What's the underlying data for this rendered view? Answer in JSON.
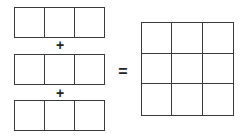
{
  "diagram": {
    "rows": [
      {
        "cells": 3
      },
      {
        "cells": 3
      },
      {
        "cells": 3
      }
    ],
    "operators": {
      "plus_1": "+",
      "plus_2": "+",
      "equals": "="
    },
    "result_grid": {
      "rows": 3,
      "cols": 3
    },
    "colors": {
      "stroke": "#3a3a3a",
      "background": "#ffffff"
    }
  }
}
